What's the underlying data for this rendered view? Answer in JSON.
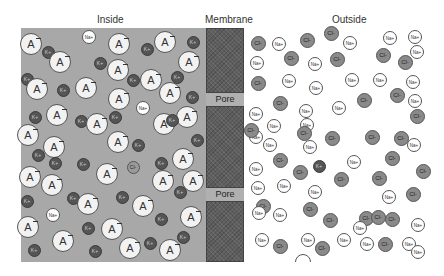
{
  "labels": {
    "inside": "Inside",
    "membrane": "Membrane",
    "outside": "Outside",
    "pore_1": "Pore",
    "pore_2": "Pore"
  },
  "glyphs": {
    "anion": "A",
    "potassium": "K+",
    "sodium": "Na+",
    "chloride": "Cl-"
  },
  "colors": {
    "inside_bg": "#a8a8a8",
    "membrane": "#5e5e5e",
    "outside_bg": "#ffffff",
    "anion_fill": "#f2f2f2",
    "potassium_fill": "#555555",
    "sodium_fill": "#ffffff",
    "chloride_fill": "#8a8a8a"
  },
  "inside_particles": [
    {
      "type": "anion",
      "x": 31,
      "y": 44
    },
    {
      "type": "k",
      "x": 48,
      "y": 52
    },
    {
      "type": "na",
      "x": 89,
      "y": 37
    },
    {
      "type": "anion",
      "x": 60,
      "y": 62
    },
    {
      "type": "anion",
      "x": 119,
      "y": 44
    },
    {
      "type": "k",
      "x": 147,
      "y": 49
    },
    {
      "type": "anion",
      "x": 165,
      "y": 42
    },
    {
      "type": "k",
      "x": 193,
      "y": 42
    },
    {
      "type": "k",
      "x": 100,
      "y": 63
    },
    {
      "type": "anion",
      "x": 189,
      "y": 62
    },
    {
      "type": "anion",
      "x": 118,
      "y": 70
    },
    {
      "type": "k",
      "x": 27,
      "y": 79
    },
    {
      "type": "anion",
      "x": 37,
      "y": 89
    },
    {
      "type": "k",
      "x": 63,
      "y": 90
    },
    {
      "type": "anion",
      "x": 86,
      "y": 88
    },
    {
      "type": "k",
      "x": 133,
      "y": 80
    },
    {
      "type": "anion",
      "x": 151,
      "y": 80
    },
    {
      "type": "k",
      "x": 177,
      "y": 77
    },
    {
      "type": "anion",
      "x": 170,
      "y": 93
    },
    {
      "type": "anion",
      "x": 119,
      "y": 99
    },
    {
      "type": "k",
      "x": 192,
      "y": 97
    },
    {
      "type": "na",
      "x": 143,
      "y": 108
    },
    {
      "type": "anion",
      "x": 57,
      "y": 115
    },
    {
      "type": "k",
      "x": 35,
      "y": 117
    },
    {
      "type": "k",
      "x": 115,
      "y": 117
    },
    {
      "type": "k",
      "x": 81,
      "y": 121
    },
    {
      "type": "anion",
      "x": 97,
      "y": 124
    },
    {
      "type": "anion",
      "x": 28,
      "y": 135
    },
    {
      "type": "anion",
      "x": 164,
      "y": 124
    },
    {
      "type": "anion",
      "x": 187,
      "y": 117
    },
    {
      "type": "k",
      "x": 172,
      "y": 120
    },
    {
      "type": "k",
      "x": 197,
      "y": 140
    },
    {
      "type": "anion",
      "x": 54,
      "y": 147
    },
    {
      "type": "anion",
      "x": 118,
      "y": 142
    },
    {
      "type": "k",
      "x": 138,
      "y": 145
    },
    {
      "type": "anion",
      "x": 183,
      "y": 159
    },
    {
      "type": "k",
      "x": 38,
      "y": 155
    },
    {
      "type": "k",
      "x": 55,
      "y": 163
    },
    {
      "type": "k",
      "x": 83,
      "y": 164
    },
    {
      "type": "cl",
      "x": 133,
      "y": 167
    },
    {
      "type": "k",
      "x": 161,
      "y": 163
    },
    {
      "type": "anion",
      "x": 30,
      "y": 177
    },
    {
      "type": "anion",
      "x": 52,
      "y": 185
    },
    {
      "type": "anion",
      "x": 107,
      "y": 174
    },
    {
      "type": "anion",
      "x": 163,
      "y": 181
    },
    {
      "type": "anion",
      "x": 193,
      "y": 181
    },
    {
      "type": "k",
      "x": 180,
      "y": 192
    },
    {
      "type": "k",
      "x": 27,
      "y": 201
    },
    {
      "type": "k",
      "x": 73,
      "y": 198
    },
    {
      "type": "anion",
      "x": 88,
      "y": 204
    },
    {
      "type": "k",
      "x": 122,
      "y": 197
    },
    {
      "type": "anion",
      "x": 143,
      "y": 206
    },
    {
      "type": "k",
      "x": 161,
      "y": 219
    },
    {
      "type": "na",
      "x": 53,
      "y": 215
    },
    {
      "type": "anion",
      "x": 191,
      "y": 217
    },
    {
      "type": "anion",
      "x": 28,
      "y": 227
    },
    {
      "type": "k",
      "x": 88,
      "y": 228
    },
    {
      "type": "anion",
      "x": 112,
      "y": 229
    },
    {
      "type": "anion",
      "x": 63,
      "y": 241
    },
    {
      "type": "k",
      "x": 183,
      "y": 237
    },
    {
      "type": "k",
      "x": 34,
      "y": 250
    },
    {
      "type": "k",
      "x": 95,
      "y": 251
    },
    {
      "type": "anion",
      "x": 130,
      "y": 248
    },
    {
      "type": "k",
      "x": 150,
      "y": 243
    },
    {
      "type": "anion",
      "x": 170,
      "y": 250
    }
  ],
  "outside_particles": [
    {
      "type": "cl",
      "x": 258,
      "y": 43
    },
    {
      "type": "na",
      "x": 279,
      "y": 44
    },
    {
      "type": "cl",
      "x": 307,
      "y": 40
    },
    {
      "type": "cl",
      "x": 331,
      "y": 33
    },
    {
      "type": "na",
      "x": 350,
      "y": 43
    },
    {
      "type": "na",
      "x": 390,
      "y": 38
    },
    {
      "type": "na",
      "x": 415,
      "y": 37
    },
    {
      "type": "na",
      "x": 257,
      "y": 63
    },
    {
      "type": "cl",
      "x": 291,
      "y": 58
    },
    {
      "type": "na",
      "x": 315,
      "y": 64
    },
    {
      "type": "cl",
      "x": 337,
      "y": 59
    },
    {
      "type": "cl",
      "x": 383,
      "y": 55
    },
    {
      "type": "cl",
      "x": 405,
      "y": 62
    },
    {
      "type": "na",
      "x": 417,
      "y": 52
    },
    {
      "type": "cl",
      "x": 258,
      "y": 83
    },
    {
      "type": "na",
      "x": 289,
      "y": 81
    },
    {
      "type": "na",
      "x": 316,
      "y": 88
    },
    {
      "type": "na",
      "x": 352,
      "y": 80
    },
    {
      "type": "na",
      "x": 380,
      "y": 80
    },
    {
      "type": "na",
      "x": 413,
      "y": 82
    },
    {
      "type": "cl",
      "x": 397,
      "y": 95
    },
    {
      "type": "na",
      "x": 415,
      "y": 101
    },
    {
      "type": "cl",
      "x": 280,
      "y": 103
    },
    {
      "type": "cl",
      "x": 364,
      "y": 100
    },
    {
      "type": "na",
      "x": 306,
      "y": 111
    },
    {
      "type": "na",
      "x": 339,
      "y": 108
    },
    {
      "type": "cl",
      "x": 417,
      "y": 116
    },
    {
      "type": "na",
      "x": 256,
      "y": 114
    },
    {
      "type": "na",
      "x": 274,
      "y": 126
    },
    {
      "type": "na",
      "x": 307,
      "y": 125
    },
    {
      "type": "cl",
      "x": 304,
      "y": 133
    },
    {
      "type": "na",
      "x": 256,
      "y": 137
    },
    {
      "type": "cl",
      "x": 332,
      "y": 138
    },
    {
      "type": "cl",
      "x": 372,
      "y": 137
    },
    {
      "type": "cl",
      "x": 401,
      "y": 138
    },
    {
      "type": "cl",
      "x": 251,
      "y": 130
    },
    {
      "type": "na",
      "x": 270,
      "y": 145
    },
    {
      "type": "na",
      "x": 310,
      "y": 147
    },
    {
      "type": "cl",
      "x": 392,
      "y": 158
    },
    {
      "type": "na",
      "x": 414,
      "y": 145
    },
    {
      "type": "cl",
      "x": 280,
      "y": 160
    },
    {
      "type": "cl",
      "x": 300,
      "y": 172
    },
    {
      "type": "k",
      "x": 319,
      "y": 166
    },
    {
      "type": "na",
      "x": 354,
      "y": 162
    },
    {
      "type": "cl",
      "x": 423,
      "y": 171
    },
    {
      "type": "na",
      "x": 256,
      "y": 169
    },
    {
      "type": "na",
      "x": 284,
      "y": 186
    },
    {
      "type": "cl",
      "x": 341,
      "y": 179
    },
    {
      "type": "cl",
      "x": 379,
      "y": 178
    },
    {
      "type": "na",
      "x": 258,
      "y": 188
    },
    {
      "type": "na",
      "x": 315,
      "y": 192
    },
    {
      "type": "na",
      "x": 389,
      "y": 197
    },
    {
      "type": "cl",
      "x": 413,
      "y": 194
    },
    {
      "type": "cl",
      "x": 310,
      "y": 209
    },
    {
      "type": "cl",
      "x": 366,
      "y": 218
    },
    {
      "type": "na",
      "x": 360,
      "y": 228
    },
    {
      "type": "cl",
      "x": 263,
      "y": 206
    },
    {
      "type": "na",
      "x": 259,
      "y": 213
    },
    {
      "type": "na",
      "x": 280,
      "y": 215
    },
    {
      "type": "cl",
      "x": 330,
      "y": 220
    },
    {
      "type": "cl",
      "x": 378,
      "y": 217
    },
    {
      "type": "cl",
      "x": 392,
      "y": 219
    },
    {
      "type": "na",
      "x": 418,
      "y": 225
    },
    {
      "type": "na",
      "x": 262,
      "y": 240
    },
    {
      "type": "cl",
      "x": 280,
      "y": 246
    },
    {
      "type": "na",
      "x": 308,
      "y": 240
    },
    {
      "type": "cl",
      "x": 322,
      "y": 248
    },
    {
      "type": "na",
      "x": 344,
      "y": 240
    },
    {
      "type": "na",
      "x": 367,
      "y": 244
    },
    {
      "type": "cl",
      "x": 385,
      "y": 244
    },
    {
      "type": "na",
      "x": 409,
      "y": 244
    },
    {
      "type": "na",
      "x": 418,
      "y": 252
    },
    {
      "type": "partial",
      "x": 303,
      "y": 262
    }
  ]
}
